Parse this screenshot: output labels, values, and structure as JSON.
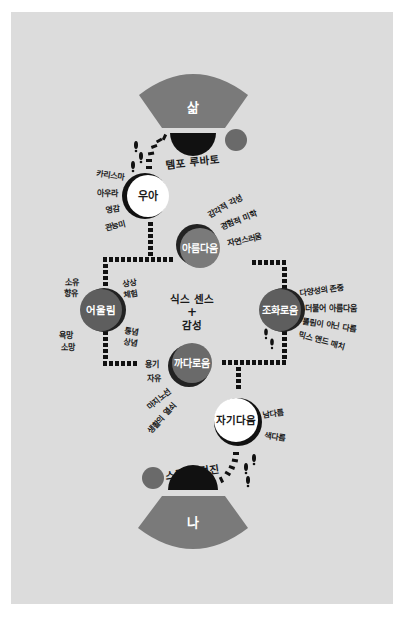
{
  "colors": {
    "background": "#dcdcdc",
    "fan": "#7a7a7a",
    "dark_circle": "#5e5e5e",
    "black": "#111111",
    "white": "#ffffff"
  },
  "top_fan": {
    "label": "삶"
  },
  "bottom_fan": {
    "label": "나"
  },
  "top_arc": {
    "label": "템포 루바토"
  },
  "bottom_arc": {
    "label": "스타일 검진"
  },
  "center": {
    "line1": "식스 센스",
    "plus": "+",
    "line2": "감성"
  },
  "nodes": {
    "elegance": {
      "label": "우아",
      "keywords": [
        "카리스마",
        "아우라",
        "영감",
        "관능미"
      ]
    },
    "beauty": {
      "label": "아름다움",
      "keywords": [
        "감각적 각성",
        "경험적 미학",
        "자연스러움"
      ]
    },
    "harmony_left": {
      "label": "어울림",
      "keywords_left": [
        "소유",
        "향유",
        "욕망",
        "소망"
      ],
      "keywords_right": [
        "상상",
        "체험",
        "통념",
        "상념"
      ]
    },
    "harmony_right": {
      "label": "조화로움",
      "keywords": [
        "다양성의 존중",
        "더불어 아름다움",
        "틀림이 아닌 다름",
        "믹스 앤드 매치"
      ]
    },
    "pickiness": {
      "label": "까다로움",
      "keywords": [
        "용기",
        "자유",
        "마지노선",
        "생활의 열쇠"
      ]
    },
    "selfhood": {
      "label": "자기다움",
      "keywords": [
        "남다름",
        "색다름"
      ]
    }
  }
}
